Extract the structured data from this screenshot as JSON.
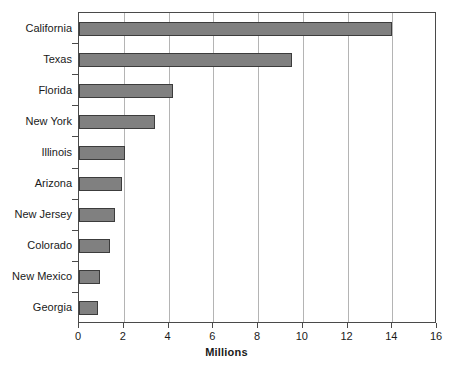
{
  "chart_data": {
    "type": "bar",
    "orientation": "horizontal",
    "title": "",
    "xlabel": "Millions",
    "ylabel": "",
    "xlim": [
      0,
      16
    ],
    "xticks": [
      0,
      2,
      4,
      6,
      8,
      10,
      12,
      14,
      16
    ],
    "xtick_labels": [
      "0",
      "2",
      "4",
      "6",
      "8",
      "10",
      "12",
      "14",
      "16"
    ],
    "grid": "vertical",
    "legend": "none",
    "categories": [
      "California",
      "Texas",
      "Florida",
      "New York",
      "Illinois",
      "Arizona",
      "New Jersey",
      "Colorado",
      "New Mexico",
      "Georgia"
    ],
    "values": [
      14.0,
      9.5,
      4.2,
      3.4,
      2.05,
      1.9,
      1.6,
      1.4,
      0.95,
      0.85
    ],
    "bar_color": "#808080",
    "bar_edge_color": "#3c3c3c",
    "gridline_color": "#b4b4b4",
    "axis_color": "#4a4a4a"
  }
}
